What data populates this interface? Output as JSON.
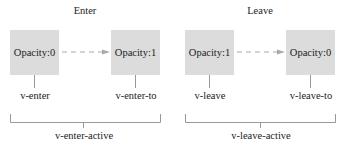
{
  "enter": {
    "title": "Enter",
    "from_box": "Opacity:0",
    "to_box": "Opacity:1",
    "start_label": "v-enter",
    "end_label": "v-enter-to",
    "active_label": "v-enter-active"
  },
  "leave": {
    "title": "Leave",
    "from_box": "Opacity:1",
    "to_box": "Opacity:0",
    "start_label": "v-leave",
    "end_label": "v-leave-to",
    "active_label": "v-leave-active"
  },
  "colors": {
    "box": "#dcdcdc",
    "line": "#999999",
    "arrow": "#aaaaaa"
  }
}
